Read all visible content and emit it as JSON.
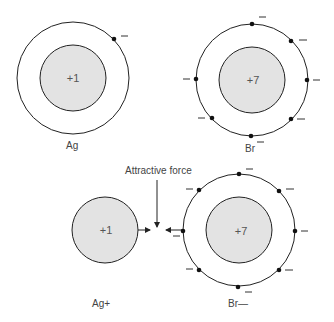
{
  "atoms": [
    {
      "id": "ag",
      "label": "Ag",
      "nucleus_charge": "+1",
      "electrons": 1
    },
    {
      "id": "br",
      "label": "Br",
      "nucleus_charge": "+7",
      "electrons": 7
    },
    {
      "id": "ag_ion",
      "label": "Ag+",
      "nucleus_charge": "+1",
      "electrons": 0
    },
    {
      "id": "br_ion",
      "label": "Br—",
      "nucleus_charge": "+7",
      "electrons": 8
    }
  ],
  "annotation": {
    "label": "Attractive force"
  },
  "electron_sign": "—",
  "colors": {
    "nucleus_fill": "#e3e3e3",
    "stroke": "#222222"
  }
}
